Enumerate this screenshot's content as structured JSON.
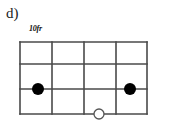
{
  "figure": {
    "label": "d)",
    "fret_position_label": "10fr"
  },
  "colors": {
    "ink": "#1a1a1a",
    "grid_line": "#4a4a4a",
    "marker_fill": "#000000",
    "open_marker_stroke": "#555555",
    "background": "#ffffff"
  },
  "chart_data": {
    "type": "diagram",
    "title": "d)",
    "subtitle": "10fr",
    "diagram_kind": "chord-fretboard-grid",
    "orientation": "horizontal",
    "grid": {
      "vertical_lines_x": [
        20,
        52,
        84,
        116,
        147
      ],
      "horizontal_lines_y": [
        42,
        64,
        89,
        114
      ],
      "columns": 4,
      "rows": 3,
      "line_color": "#4a4a4a",
      "line_width": 1.6
    },
    "markers": [
      {
        "id": "marker-1",
        "style": "filled",
        "x": 38,
        "y": 89,
        "radius": 6
      },
      {
        "id": "marker-2",
        "style": "filled",
        "x": 130,
        "y": 89,
        "radius": 6
      },
      {
        "id": "marker-3",
        "style": "open",
        "x": 99,
        "y": 114,
        "radius": 5
      }
    ],
    "annotations": [
      {
        "id": "figure-label",
        "text": "d)",
        "x": 8,
        "y": 20
      },
      {
        "id": "fret-label",
        "text": "10fr",
        "x": 30,
        "y": 33
      }
    ]
  }
}
